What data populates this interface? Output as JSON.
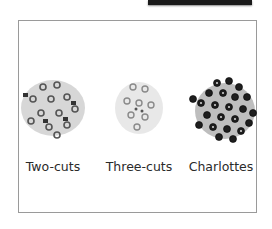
{
  "header": {
    "bar_color": "#1a1a1a"
  },
  "items": [
    {
      "label": "Two-cuts",
      "bead_color": "#8a8a8a",
      "outline": "#555555"
    },
    {
      "label": "Three-cuts",
      "bead_color": "#c8c8c8",
      "outline": "#9a9a9a"
    },
    {
      "label": "Charlottes",
      "bead_color": "#2a2a2a",
      "outline": "#111111"
    }
  ]
}
